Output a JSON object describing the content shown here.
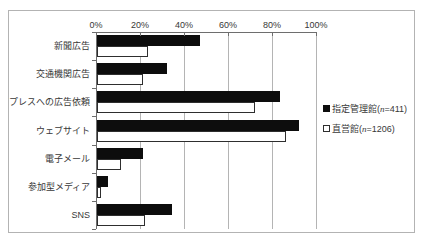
{
  "chart_data": {
    "type": "bar",
    "orientation": "horizontal",
    "title": "",
    "xlabel": "",
    "ylabel": "",
    "xlim": [
      0,
      100
    ],
    "x_tick_labels": [
      "0%",
      "20%",
      "40%",
      "60%",
      "80%",
      "100%"
    ],
    "x_tick_values": [
      0,
      20,
      40,
      60,
      80,
      100
    ],
    "grid": "vertical-only",
    "legend_position": "right",
    "categories": [
      "新聞広告",
      "交通機関広告",
      "プレスへの広告依頼",
      "ウェブサイト",
      "電子メール",
      "参加型メディア",
      "SNS"
    ],
    "series": [
      {
        "name": "指定管理館",
        "n_label": "n",
        "n_value": "411",
        "legend_text": "指定管理館(n=411)",
        "style": "solid",
        "color": "#0d0d0d",
        "values": [
          47,
          32,
          83,
          92,
          21,
          5,
          34
        ]
      },
      {
        "name": "直営館",
        "n_label": "n",
        "n_value": "1206",
        "legend_text": "直営館(n=1206)",
        "style": "outline",
        "color": "#ffffff",
        "values": [
          23,
          21,
          72,
          86,
          11,
          2,
          22
        ]
      }
    ]
  },
  "colors": {
    "frame_border": "#b3b3b3",
    "axis": "#6e6e6e",
    "gridline": "#b4b4b4",
    "text": "#383838",
    "bar_solid": "#0d0d0d",
    "bar_outline_border": "#2e2e2e",
    "background": "#ffffff"
  }
}
